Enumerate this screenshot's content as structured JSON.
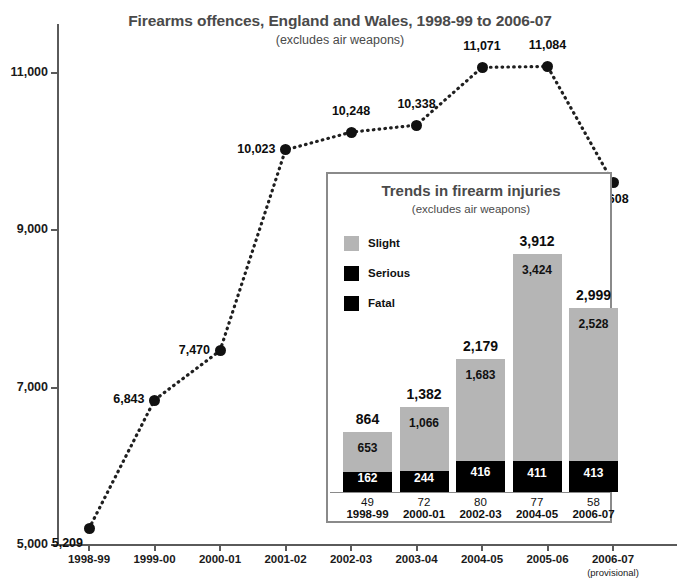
{
  "main": {
    "title": "Firearms offences, England and Wales, 1998-99 to 2006-07",
    "subtitle": "(excludes air weapons)",
    "cut_off_strip": ""
  },
  "chart_data": [
    {
      "type": "line",
      "title": "Firearms offences, England and Wales, 1998-99 to 2006-07",
      "subtitle": "(excludes air weapons)",
      "xlabel": "",
      "ylabel": "",
      "ylim": [
        5000,
        11500
      ],
      "yticks": [
        5000,
        7000,
        9000,
        11000
      ],
      "ytick_labels": [
        "5,000",
        "7,000",
        "9,000",
        "11,000"
      ],
      "grid": false,
      "legend": "none",
      "linestyle": "dotted",
      "marker": "filled-circle",
      "categories": [
        "1998-99",
        "1999-00",
        "2000-01",
        "2001-02",
        "2002-03",
        "2003-04",
        "2004-05",
        "2005-06",
        "2006-07"
      ],
      "category_sublabels": [
        "",
        "",
        "",
        "",
        "",
        "",
        "",
        "",
        "(provisional)"
      ],
      "values": [
        5209,
        6843,
        7470,
        10023,
        10248,
        10338,
        11071,
        11084,
        9608
      ],
      "point_labels": [
        "5,209",
        "6,843",
        "7,470",
        "10,023",
        "10,248",
        "10,338",
        "11,071",
        "11,084",
        "9,608"
      ]
    },
    {
      "type": "bar",
      "subtype": "stacked",
      "title": "Trends in firearm injuries",
      "subtitle": "(excludes air weapons)",
      "xlabel": "",
      "ylabel": "",
      "grid": false,
      "legend_position": "upper-left",
      "legend": [
        {
          "name": "Slight",
          "color": "#b5b5b5"
        },
        {
          "name": "Serious",
          "color": "#000000"
        },
        {
          "name": "Fatal",
          "color": "#000000"
        }
      ],
      "categories": [
        "1998-99",
        "2000-01",
        "2002-03",
        "2004-05",
        "2006-07"
      ],
      "series": [
        {
          "name": "Slight",
          "values": [
            653,
            1066,
            1683,
            3424,
            2528
          ],
          "labels": [
            "653",
            "1,066",
            "1,683",
            "3,424",
            "2,528"
          ]
        },
        {
          "name": "Serious",
          "values": [
            162,
            244,
            416,
            411,
            413
          ],
          "labels": [
            "162",
            "244",
            "416",
            "411",
            "413"
          ]
        },
        {
          "name": "Fatal",
          "values": [
            49,
            72,
            80,
            77,
            58
          ],
          "labels": [
            "49",
            "72",
            "80",
            "77",
            "58"
          ]
        }
      ],
      "totals": [
        864,
        1382,
        2179,
        3912,
        2999
      ],
      "total_labels": [
        "864",
        "1,382",
        "2,179",
        "3,912",
        "2,999"
      ]
    }
  ],
  "colors": {
    "slight": "#b5b5b5",
    "serious": "#000000",
    "fatal": "#000000",
    "axis": "#5a5a5a",
    "title": "#4a4a4a",
    "text": "#111111"
  }
}
